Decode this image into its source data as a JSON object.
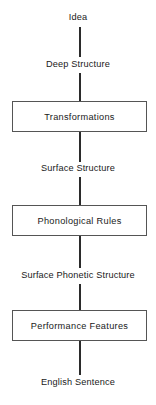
{
  "diagram": {
    "orientation": "vertical",
    "line_color": "#2b2b2b",
    "box_border_color": "#555555",
    "background_color": "#ffffff",
    "nodes": [
      {
        "id": "idea",
        "label": "Idea",
        "type": "label",
        "top": 12
      },
      {
        "id": "deep-structure",
        "label": "Deep Structure",
        "type": "label",
        "top": 59
      },
      {
        "id": "transformations",
        "label": "Transformations",
        "type": "box",
        "top": 101
      },
      {
        "id": "surface-structure",
        "label": "Surface Structure",
        "type": "label",
        "top": 163
      },
      {
        "id": "phonological-rules",
        "label": "Phonological Rules",
        "type": "box",
        "top": 205
      },
      {
        "id": "surface-phonetic-structure",
        "label": "Surface Phonetic Structure",
        "type": "label",
        "top": 270
      },
      {
        "id": "performance-features",
        "label": "Performance Features",
        "type": "box",
        "top": 310
      },
      {
        "id": "english-sentence",
        "label": "English Sentence",
        "type": "label",
        "top": 377
      }
    ],
    "connectors": [
      {
        "id": "idea-to-deep-structure",
        "top": 27,
        "height": 30
      },
      {
        "id": "deep-structure-to-transformations",
        "top": 73,
        "height": 28
      },
      {
        "id": "transformations-to-surface-structure",
        "top": 132,
        "height": 30
      },
      {
        "id": "surface-structure-to-phonological-rules",
        "top": 177,
        "height": 28
      },
      {
        "id": "phonological-rules-to-surface-phonetic",
        "top": 236,
        "height": 32
      },
      {
        "id": "surface-phonetic-to-performance-features",
        "top": 284,
        "height": 26
      },
      {
        "id": "performance-features-to-english-sentence",
        "top": 341,
        "height": 34
      }
    ]
  }
}
